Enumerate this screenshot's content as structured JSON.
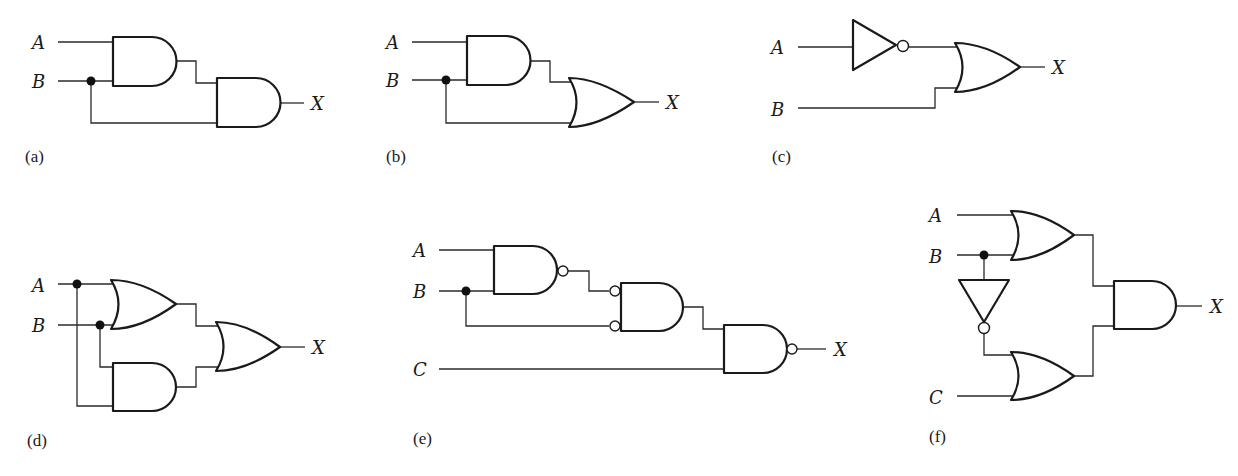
{
  "figure": {
    "colors": {
      "ink": "#1a1a1a",
      "background": "#ffffff"
    }
  },
  "circuits": [
    {
      "id": "a",
      "caption": "(a)",
      "inputs": [
        "A",
        "B"
      ],
      "output": "X",
      "gates": [
        "AND",
        "AND"
      ],
      "expression": "X = (A·B)·B"
    },
    {
      "id": "b",
      "caption": "(b)",
      "inputs": [
        "A",
        "B"
      ],
      "output": "X",
      "gates": [
        "AND",
        "OR"
      ],
      "expression": "X = (A·B) + B"
    },
    {
      "id": "c",
      "caption": "(c)",
      "inputs": [
        "A",
        "B"
      ],
      "output": "X",
      "gates": [
        "NOT",
        "OR"
      ],
      "expression": "X = A' + B"
    },
    {
      "id": "d",
      "caption": "(d)",
      "inputs": [
        "A",
        "B"
      ],
      "output": "X",
      "gates": [
        "OR",
        "AND",
        "OR"
      ],
      "expression": "X = (A + B) + (B·A)"
    },
    {
      "id": "e",
      "caption": "(e)",
      "inputs": [
        "A",
        "B",
        "C"
      ],
      "output": "X",
      "gates": [
        "NAND",
        "AND (inverted inputs)",
        "NAND"
      ],
      "expression": "X = ((A·B)'' · B')' · C)'"
    },
    {
      "id": "f",
      "caption": "(f)",
      "inputs": [
        "A",
        "B",
        "C"
      ],
      "output": "X",
      "gates": [
        "OR",
        "NOT",
        "OR",
        "AND"
      ],
      "expression": "X = (A + B)·(B' + C)"
    }
  ]
}
